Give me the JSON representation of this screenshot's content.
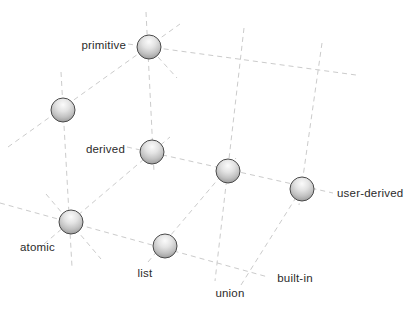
{
  "diagram": {
    "canvas": {
      "width": 412,
      "height": 314,
      "background": "#ffffff"
    },
    "style": {
      "line_color": "#cbcbcb",
      "line_dash": "5 4",
      "label_color": "#2b2b2b",
      "sphere": {
        "radius": 12,
        "outline": "#4a4a4a",
        "top": "#fbfbfb",
        "upper_mid": "#e3e3e3",
        "lower_mid": "#c2c2c2",
        "bottom": "#8d8d8d"
      }
    },
    "nodes": [
      {
        "id": "primitive",
        "label": "primitive",
        "x": 149,
        "y": 47,
        "label_x": 126,
        "label_y": 49,
        "label_anchor": "end"
      },
      {
        "id": "front-top",
        "label": "",
        "x": 63,
        "y": 110
      },
      {
        "id": "derived",
        "label": "derived",
        "x": 152,
        "y": 152,
        "label_x": 125,
        "label_y": 153,
        "label_anchor": "end"
      },
      {
        "id": "back-middle",
        "label": "",
        "x": 228,
        "y": 171
      },
      {
        "id": "user-derived",
        "label": "user-derived",
        "x": 302,
        "y": 189,
        "label_x": 337,
        "label_y": 197,
        "label_anchor": "start"
      },
      {
        "id": "atomic",
        "label": "atomic",
        "x": 71,
        "y": 222,
        "label_x": 20,
        "label_y": 251,
        "label_anchor": "start"
      },
      {
        "id": "list",
        "label": "list",
        "x": 165,
        "y": 246,
        "label_x": 145,
        "label_y": 277,
        "label_anchor": "middle"
      }
    ],
    "floating_labels": [
      {
        "id": "union",
        "label": "union",
        "x": 230,
        "y": 297,
        "anchor": "middle"
      },
      {
        "id": "built-in",
        "label": "built-in",
        "x": 295,
        "y": 282,
        "anchor": "middle"
      }
    ],
    "segments": [
      {
        "id": "vertical-back-left",
        "x1": 146,
        "y1": 12,
        "x2": 154,
        "y2": 172
      },
      {
        "id": "row-top",
        "x1": 128,
        "y1": 44,
        "x2": 356,
        "y2": 75
      },
      {
        "id": "vertical-back-middle",
        "x1": 244,
        "y1": 28,
        "x2": 215,
        "y2": 281
      },
      {
        "id": "vertical-back-right",
        "x1": 322,
        "y1": 43,
        "x2": 299,
        "y2": 205
      },
      {
        "id": "row-middle",
        "x1": 127,
        "y1": 147,
        "x2": 333,
        "y2": 193
      },
      {
        "id": "row-bottom",
        "x1": 0,
        "y1": 203,
        "x2": 268,
        "y2": 277
      },
      {
        "id": "depth-primitive",
        "x1": 8,
        "y1": 147,
        "x2": 180,
        "y2": 24
      },
      {
        "id": "depth-derived",
        "x1": 44,
        "y1": 244,
        "x2": 170,
        "y2": 137
      },
      {
        "id": "depth-middle",
        "x1": 148,
        "y1": 262,
        "x2": 236,
        "y2": 158
      },
      {
        "id": "depth-right",
        "x1": 241,
        "y1": 285,
        "x2": 307,
        "y2": 180
      },
      {
        "id": "vertical-front-left",
        "x1": 61,
        "y1": 72,
        "x2": 72,
        "y2": 267
      },
      {
        "id": "cross-atomic",
        "x1": 46,
        "y1": 194,
        "x2": 101,
        "y2": 259
      },
      {
        "id": "cross-primitive",
        "x1": 158,
        "y1": 57,
        "x2": 177,
        "y2": 78
      }
    ]
  }
}
